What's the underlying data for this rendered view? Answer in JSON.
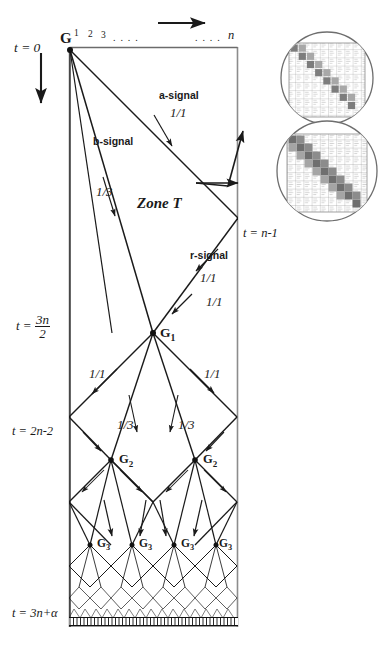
{
  "figure": {
    "type": "space-time-diagram",
    "zone_label": "Zone T",
    "cell_index_labels": [
      "1",
      "2",
      "3",
      ". . . .",
      ". . . .",
      "n"
    ],
    "axis": {
      "horizontal_arrow": "cell-axis-arrow",
      "vertical_arrow": "time-axis-arrow"
    },
    "time_labels": [
      {
        "id": "t0",
        "text": "t = 0",
        "kind": "plain"
      },
      {
        "id": "tn1",
        "text": "t = n-1",
        "kind": "plain"
      },
      {
        "id": "t3n2",
        "text": "t =",
        "kind": "fraction",
        "numerator": "3n",
        "denominator": "2"
      },
      {
        "id": "t2n2",
        "text": "t = 2n-2",
        "kind": "plain"
      },
      {
        "id": "t3na",
        "text": "t = 3n+α",
        "kind": "plain"
      }
    ],
    "signals": [
      {
        "name": "a-signal",
        "label": "a-signal",
        "speed": "1/1"
      },
      {
        "name": "b-signal",
        "label": "b-signal",
        "speed": "1/3"
      },
      {
        "name": "r-signal",
        "label": "r-signal",
        "speed": "1/1"
      }
    ],
    "speed_labels": [
      {
        "id": "a-speed",
        "text": "1/1"
      },
      {
        "id": "b-speed",
        "text": "1/3"
      },
      {
        "id": "r-speed",
        "text": "1/1"
      },
      {
        "id": "g1-left",
        "text": "1/1"
      },
      {
        "id": "g1-right",
        "text": "1/1"
      },
      {
        "id": "g1-in",
        "text": "1/1"
      },
      {
        "id": "g2-left13",
        "text": "1/3"
      },
      {
        "id": "g2-right13",
        "text": "1/3"
      }
    ],
    "generals": [
      {
        "id": "G",
        "label": "G",
        "sub": ""
      },
      {
        "id": "G1",
        "label": "G",
        "sub": "1"
      },
      {
        "id": "G2a",
        "label": "G",
        "sub": "2"
      },
      {
        "id": "G2b",
        "label": "G",
        "sub": "2"
      },
      {
        "id": "G3a",
        "label": "G",
        "sub": "3"
      },
      {
        "id": "G3b",
        "label": "G",
        "sub": "3"
      },
      {
        "id": "G3c",
        "label": "G",
        "sub": "3"
      },
      {
        "id": "G3d",
        "label": "G",
        "sub": "3"
      }
    ],
    "insets": [
      {
        "id": "inset-top",
        "name": "magnifier-inset-upper",
        "content": "cell-state-grid-diagonal"
      },
      {
        "id": "inset-bottom",
        "name": "magnifier-inset-lower",
        "content": "cell-state-grid-diagonal-band"
      }
    ],
    "colors": {
      "line": "#1a1a1a",
      "background": "#ffffff",
      "grid_faint": "#b8b8b8",
      "grid_dark": "#6b6b6b"
    }
  }
}
